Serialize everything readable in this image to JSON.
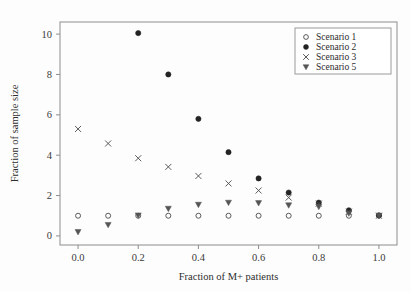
{
  "chart_data": {
    "type": "scatter",
    "title": "",
    "xlabel": "Fraction of M+ patients",
    "ylabel": "Fraction of sample size",
    "xlim": [
      -0.06,
      1.06
    ],
    "ylim": [
      -0.45,
      10.6
    ],
    "xticks": [
      "0.0",
      "0.2",
      "0.4",
      "0.6",
      "0.8",
      "1.0"
    ],
    "xtick_values": [
      0.0,
      0.2,
      0.4,
      0.6,
      0.8,
      1.0
    ],
    "yticks": [
      "0",
      "2",
      "4",
      "6",
      "8",
      "10"
    ],
    "ytick_values": [
      0,
      2,
      4,
      6,
      8,
      10
    ],
    "grid": false,
    "legend_position": "upper-right",
    "x": [
      0.0,
      0.1,
      0.2,
      0.3,
      0.4,
      0.5,
      0.6,
      0.7,
      0.8,
      0.9,
      1.0
    ],
    "series": [
      {
        "name": "Scenario 1",
        "marker": "open-circle",
        "color": "#4a4a4a",
        "values": [
          1.0,
          1.0,
          1.0,
          1.0,
          1.0,
          1.0,
          1.0,
          1.0,
          1.0,
          1.0,
          1.0
        ]
      },
      {
        "name": "Scenario 2",
        "marker": "filled-circle",
        "color": "#232323",
        "values": [
          null,
          null,
          10.05,
          8.0,
          5.8,
          4.15,
          2.85,
          2.15,
          1.65,
          1.27,
          1.02
        ]
      },
      {
        "name": "Scenario 3",
        "marker": "cross",
        "color": "#4a4a4a",
        "values": [
          5.3,
          4.58,
          3.85,
          3.42,
          2.97,
          2.6,
          2.25,
          1.9,
          1.6,
          1.2,
          1.0
        ]
      },
      {
        "name": "Scenario 5",
        "marker": "filled-triangle-down",
        "color": "#555555",
        "values": [
          0.2,
          0.55,
          1.02,
          1.35,
          1.55,
          1.65,
          1.63,
          1.52,
          1.45,
          1.12,
          1.0
        ]
      }
    ]
  },
  "legend": {
    "entries": [
      {
        "label": "Scenario 1"
      },
      {
        "label": "Scenario 2"
      },
      {
        "label": "Scenario 3"
      },
      {
        "label": "Scenario 5"
      }
    ]
  }
}
